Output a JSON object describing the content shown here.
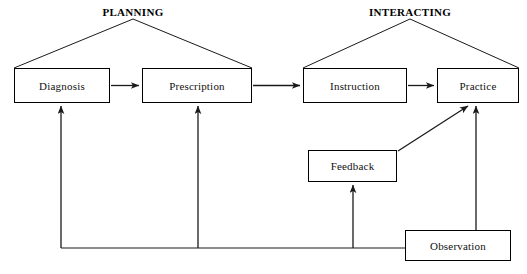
{
  "diagram": {
    "stroke_color": "#1a1a1a",
    "box_fill": "#ffffff",
    "text_color": "#111111",
    "groups": [
      {
        "id": "planning",
        "label": "PLANNING",
        "x": 133,
        "y": 13
      },
      {
        "id": "interacting",
        "label": "INTERACTING",
        "x": 410,
        "y": 13
      }
    ],
    "nodes": [
      {
        "id": "diagnosis",
        "label": "Diagnosis",
        "x": 14,
        "y": 68,
        "w": 96,
        "h": 35
      },
      {
        "id": "prescription",
        "label": "Prescription",
        "x": 142,
        "y": 68,
        "w": 110,
        "h": 35
      },
      {
        "id": "instruction",
        "label": "Instruction",
        "x": 303,
        "y": 68,
        "w": 104,
        "h": 35
      },
      {
        "id": "practice",
        "label": "Practice",
        "x": 437,
        "y": 68,
        "w": 82,
        "h": 35
      },
      {
        "id": "feedback",
        "label": "Feedback",
        "x": 308,
        "y": 150,
        "w": 89,
        "h": 32
      },
      {
        "id": "observation",
        "label": "Observation",
        "x": 405,
        "y": 230,
        "w": 106,
        "h": 31
      }
    ],
    "connectors": [
      {
        "id": "diagnosis-to-prescription",
        "from": "diagnosis",
        "to": "prescription",
        "kind": "arrow-right"
      },
      {
        "id": "prescription-to-instruction",
        "from": "prescription",
        "to": "instruction",
        "kind": "arrow-right"
      },
      {
        "id": "instruction-to-practice",
        "from": "instruction",
        "to": "practice",
        "kind": "arrow-right"
      },
      {
        "id": "feedback-to-practice",
        "from": "feedback",
        "to": "practice",
        "kind": "arrow-diagonal"
      },
      {
        "id": "observation-to-practice",
        "from": "observation",
        "to": "practice",
        "kind": "arrow-up"
      },
      {
        "id": "observation-to-feedback",
        "from": "observation",
        "to": "feedback",
        "kind": "arrow-up-elbow"
      },
      {
        "id": "observation-to-prescription",
        "from": "observation",
        "to": "prescription",
        "kind": "arrow-up-elbow"
      },
      {
        "id": "observation-to-diagnosis",
        "from": "observation",
        "to": "diagnosis",
        "kind": "arrow-up-elbow"
      },
      {
        "id": "planning-bracket-left",
        "from": "planning",
        "to": "diagnosis",
        "kind": "bracket"
      },
      {
        "id": "planning-bracket-right",
        "from": "planning",
        "to": "prescription",
        "kind": "bracket"
      },
      {
        "id": "interacting-bracket-left",
        "from": "interacting",
        "to": "instruction",
        "kind": "bracket"
      },
      {
        "id": "interacting-bracket-right",
        "from": "interacting",
        "to": "practice",
        "kind": "bracket"
      }
    ]
  }
}
